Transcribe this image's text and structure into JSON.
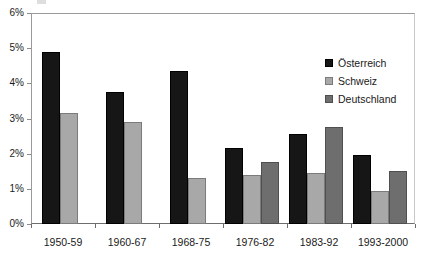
{
  "chart_data": {
    "type": "bar",
    "title": "",
    "xlabel": "",
    "ylabel": "",
    "ylim": [
      0,
      6
    ],
    "ytick_labels": [
      "6%",
      "5%",
      "4%",
      "3%",
      "2%",
      "1%",
      "0%"
    ],
    "ytick_values": [
      6,
      5,
      4,
      3,
      2,
      1,
      0
    ],
    "grid": false,
    "legend_position": "upper-right-inside",
    "categories": [
      "1950-59",
      "1960-67",
      "1968-75",
      "1976-82",
      "1983-92",
      "1993-2000"
    ],
    "series": [
      {
        "name": "Österreich",
        "color": "#161616",
        "values": [
          4.9,
          3.75,
          4.35,
          2.15,
          2.55,
          1.95
        ]
      },
      {
        "name": "Schweiz",
        "color": "#a8a8a8",
        "values": [
          3.15,
          2.9,
          1.3,
          1.4,
          1.45,
          0.95
        ]
      },
      {
        "name": "Deutschland",
        "color": "#6e6e6e",
        "values": [
          null,
          null,
          null,
          1.75,
          2.75,
          1.5
        ]
      }
    ]
  },
  "legend": {
    "entries": [
      {
        "label": "Österreich",
        "swatch": "series-at"
      },
      {
        "label": "Schweiz",
        "swatch": "series-ch"
      },
      {
        "label": "Deutschland",
        "swatch": "series-de"
      }
    ]
  },
  "axis": {
    "y_labels": [
      "6%",
      "5%",
      "4%",
      "3%",
      "2%",
      "1%",
      "0%"
    ],
    "x_labels": [
      "1950-59",
      "1960-67",
      "1968-75",
      "1976-82",
      "1983-92",
      "1993-2000"
    ]
  }
}
